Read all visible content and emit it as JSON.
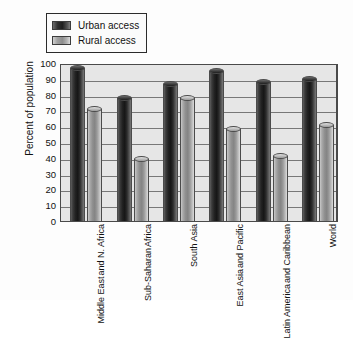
{
  "chart_data": {
    "type": "bar",
    "title": "",
    "subtitle": "",
    "xlabel": "",
    "ylabel": "Percent of population",
    "ylim": [
      0,
      100
    ],
    "ytick_step": 10,
    "yticks": [
      0,
      10,
      20,
      30,
      40,
      50,
      60,
      70,
      80,
      90,
      100
    ],
    "grid": true,
    "grid_axis": "y",
    "legend_position": "top-left",
    "categories": [
      "Middle East and N. Africa",
      "Sub-Saharan Africa",
      "South Asia",
      "East Asia and Pacific",
      "Latin America and Caribbean",
      "World"
    ],
    "category_lines": [
      [
        "Middle East",
        "and N. Africa"
      ],
      [
        "Sub-Saharan",
        "Africa"
      ],
      [
        "South Asia"
      ],
      [
        "East Asia",
        "and Pacific"
      ],
      [
        "Latin America",
        "and Caribbean"
      ],
      [
        "World"
      ]
    ],
    "series": [
      {
        "name": "Urban access",
        "color": "#232323",
        "values": [
          97,
          78,
          87,
          95,
          88,
          90
        ]
      },
      {
        "name": "Rural access",
        "color": "#9a9a9a",
        "values": [
          71,
          39,
          78,
          58,
          41,
          61
        ]
      }
    ]
  },
  "legend": {
    "items": [
      {
        "label": "Urban access",
        "swatch": "urban"
      },
      {
        "label": "Rural access",
        "swatch": "rural"
      }
    ]
  },
  "axis": {
    "y_title": "Percent of population"
  },
  "colors": {
    "urban": "#232323",
    "rural": "#9a9a9a",
    "plot_background": "#e6e6e6",
    "gridline": "#777777",
    "axis": "#4a4a4a",
    "text": "#111111"
  }
}
